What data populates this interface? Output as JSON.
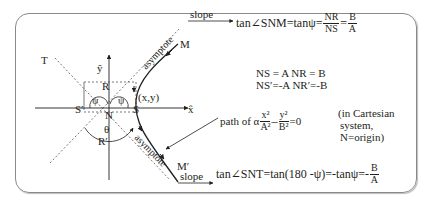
{
  "diagram": {
    "labels": {
      "T": "T",
      "y_axis": "ŷ",
      "x_axis": "x̂",
      "R_top": "R",
      "R_bottom": "R′",
      "S_right": "S",
      "S_left": "S′",
      "N": "N",
      "psi": "ψ",
      "theta": "θ",
      "point": "(x,y)",
      "M_top": "M",
      "M_bottom": "M′",
      "asymptote": "asymptote",
      "slope": "slope"
    },
    "equations": {
      "top_prefix": "tan∠SNM=tanψ=",
      "top_frac1_num": "NR",
      "top_frac1_den": "NS",
      "eq_sign": "=",
      "top_frac2_num": "B",
      "top_frac2_den": "A",
      "ns_line1": "NS = A  NR = B",
      "ns_line2": "NS′=-A  NR′=-B",
      "path_prefix": "path of α",
      "path_frac1_num": "x²",
      "path_frac1_den": "A²",
      "minus": "–",
      "path_frac2_num": "y²",
      "path_frac2_den": "B²",
      "path_suffix": "=0",
      "cartesian_1": "(in Cartesian",
      "cartesian_2": "system,",
      "cartesian_3": "N=origin)",
      "bottom_prefix": "tan∠SNT=tan(180 -ψ)=-tanψ=-",
      "bottom_frac_num": "B",
      "bottom_frac_den": "A"
    }
  }
}
